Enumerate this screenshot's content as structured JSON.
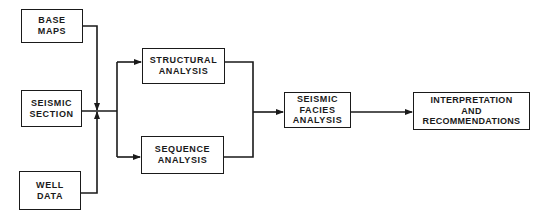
{
  "diagram": {
    "type": "flowchart",
    "colors": {
      "line": "#1a1a1a",
      "background": "#ffffff"
    },
    "nodes": {
      "base_maps": {
        "lines": [
          "BASE",
          "MAPS"
        ]
      },
      "seismic_section": {
        "lines": [
          "SEISMIC",
          "SECTION"
        ]
      },
      "well_data": {
        "lines": [
          "WELL",
          "DATA"
        ]
      },
      "structural_analysis": {
        "lines": [
          "STRUCTURAL",
          "ANALYSIS"
        ]
      },
      "sequence_analysis": {
        "lines": [
          "SEQUENCE",
          "ANALYSIS"
        ]
      },
      "seismic_facies_analysis": {
        "lines": [
          "SEISMIC",
          "FACIES",
          "ANALYSIS"
        ]
      },
      "interpretation": {
        "lines": [
          "INTERPRETATION",
          "AND",
          "RECOMMENDATIONS"
        ]
      }
    },
    "edges": [
      {
        "from": "base_maps",
        "to": "junction_input"
      },
      {
        "from": "seismic_section",
        "to": "junction_input"
      },
      {
        "from": "well_data",
        "to": "junction_input"
      },
      {
        "from": "junction_input",
        "to": "structural_analysis"
      },
      {
        "from": "junction_input",
        "to": "sequence_analysis"
      },
      {
        "from": "structural_analysis",
        "to": "seismic_facies_analysis"
      },
      {
        "from": "sequence_analysis",
        "to": "seismic_facies_analysis"
      },
      {
        "from": "seismic_facies_analysis",
        "to": "interpretation"
      }
    ]
  }
}
